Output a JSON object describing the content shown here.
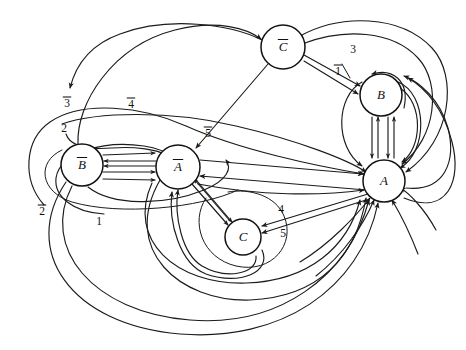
{
  "figure": {
    "type": "directed-multigraph",
    "background_color": "#ffffff",
    "line_color": "#1b1b1b",
    "width": 466,
    "height": 350
  },
  "nodes": [
    {
      "id": "Cbar",
      "label": "C",
      "overbar": true,
      "cx": 283,
      "cy": 47,
      "r": 22
    },
    {
      "id": "B",
      "label": "B",
      "overbar": false,
      "cx": 381,
      "cy": 95,
      "r": 21
    },
    {
      "id": "A",
      "label": "A",
      "overbar": false,
      "cx": 384,
      "cy": 181,
      "r": 21
    },
    {
      "id": "Bbar",
      "label": "B",
      "overbar": true,
      "cx": 82,
      "cy": 165,
      "r": 21
    },
    {
      "id": "Abar",
      "label": "A",
      "overbar": true,
      "cx": 178,
      "cy": 167,
      "r": 22
    },
    {
      "id": "C",
      "label": "C",
      "overbar": false,
      "cx": 243,
      "cy": 237,
      "r": 18
    }
  ],
  "edge_labels": [
    {
      "id": "lbl-3bar",
      "text": "3",
      "overbar": true,
      "x": 67,
      "y": 104
    },
    {
      "id": "lbl-4bar",
      "text": "4",
      "overbar": true,
      "x": 131,
      "y": 105
    },
    {
      "id": "lbl-2",
      "text": "2",
      "overbar": false,
      "x": 64,
      "y": 129
    },
    {
      "id": "lbl-5bar",
      "text": "5",
      "overbar": true,
      "x": 208,
      "y": 134
    },
    {
      "id": "lbl-2bar",
      "text": "2",
      "overbar": true,
      "x": 42,
      "y": 212
    },
    {
      "id": "lbl-1",
      "text": "1",
      "overbar": false,
      "x": 99,
      "y": 222
    },
    {
      "id": "lbl-3",
      "text": "3",
      "overbar": false,
      "x": 353,
      "y": 50
    },
    {
      "id": "lbl-1bar",
      "text": "1",
      "overbar": true,
      "x": 338,
      "y": 72
    },
    {
      "id": "lbl-4",
      "text": "4",
      "overbar": false,
      "x": 281,
      "y": 210
    },
    {
      "id": "lbl-5",
      "text": "5",
      "overbar": false,
      "x": 283,
      "y": 234
    }
  ],
  "edges": [
    {
      "id": "e-bbar-abar-1",
      "from": "Bbar",
      "to": "Abar",
      "kind": "parallel",
      "label": null
    },
    {
      "id": "e-bbar-abar-2",
      "from": "Bbar",
      "to": "Abar",
      "kind": "parallel",
      "label": null
    },
    {
      "id": "e-bbar-abar-3",
      "from": "Bbar",
      "to": "Abar",
      "kind": "parallel",
      "label": null
    },
    {
      "id": "e-abar-bbar-1",
      "from": "Abar",
      "to": "Bbar",
      "kind": "parallel",
      "label": null
    },
    {
      "id": "e-abar-bbar-2",
      "from": "Abar",
      "to": "Bbar",
      "kind": "parallel",
      "label": null
    },
    {
      "id": "e-b-a-1",
      "from": "B",
      "to": "A",
      "kind": "parallel",
      "label": null
    },
    {
      "id": "e-b-a-2",
      "from": "B",
      "to": "A",
      "kind": "parallel",
      "label": null
    },
    {
      "id": "e-a-b-1",
      "from": "A",
      "to": "B",
      "kind": "parallel",
      "label": null
    },
    {
      "id": "e-a-b-2",
      "from": "A",
      "to": "B",
      "kind": "parallel",
      "label": null
    },
    {
      "id": "e-abar-c-1",
      "from": "Abar",
      "to": "C",
      "kind": "parallel",
      "label": null
    },
    {
      "id": "e-abar-c-2",
      "from": "Abar",
      "to": "C",
      "kind": "parallel",
      "label": null
    },
    {
      "id": "e-a-c-4",
      "from": "A",
      "to": "C",
      "kind": "straight",
      "label": "4"
    },
    {
      "id": "e-a-c-5",
      "from": "A",
      "to": "C",
      "kind": "straight",
      "label": "5"
    },
    {
      "id": "e-cbar-b-3",
      "from": "Cbar",
      "to": "B",
      "kind": "straight",
      "label": "3"
    },
    {
      "id": "e-cbar-b-1bar",
      "from": "Cbar",
      "to": "B",
      "kind": "straight",
      "label": "1"
    },
    {
      "id": "e-cbar-abar",
      "from": "Cbar",
      "to": "Abar",
      "kind": "straight",
      "label": null
    },
    {
      "id": "e-abar-a",
      "from": "Abar",
      "to": "A",
      "kind": "straight",
      "label": null
    },
    {
      "id": "e-a-abar",
      "from": "A",
      "to": "Abar",
      "kind": "straight",
      "label": null
    },
    {
      "id": "e-bbar-cbar",
      "from": "Bbar",
      "to": "Cbar",
      "kind": "arc",
      "label": "3"
    },
    {
      "id": "e-bbar-abar-arc",
      "from": "Bbar",
      "to": "Abar",
      "kind": "arc",
      "label": "4"
    },
    {
      "id": "e-bbar-loop-2",
      "from": "Bbar",
      "to": "Abar",
      "kind": "arc",
      "label": "2"
    },
    {
      "id": "e-bbar-a-2bar",
      "from": "Bbar",
      "to": "A",
      "kind": "arc",
      "label": "2"
    },
    {
      "id": "e-bbar-a-1",
      "from": "Bbar",
      "to": "A",
      "kind": "arc",
      "label": "1"
    },
    {
      "id": "e-c-abar-1",
      "from": "C",
      "to": "Abar",
      "kind": "arc",
      "label": null
    },
    {
      "id": "e-c-abar-2",
      "from": "C",
      "to": "Abar",
      "kind": "arc",
      "label": null
    },
    {
      "id": "e-a-abar-arc-1",
      "from": "A",
      "to": "Abar",
      "kind": "arc",
      "label": null
    },
    {
      "id": "e-a-abar-arc-2",
      "from": "A",
      "to": "Abar",
      "kind": "arc",
      "label": null
    },
    {
      "id": "e-a-abar-arc-3",
      "from": "A",
      "to": "Abar",
      "kind": "arc",
      "label": null
    },
    {
      "id": "e-b-outer-1",
      "from": "B",
      "to": "A",
      "kind": "arc",
      "label": null
    },
    {
      "id": "e-b-outer-2",
      "from": "B",
      "to": "A",
      "kind": "arc",
      "label": null
    }
  ]
}
